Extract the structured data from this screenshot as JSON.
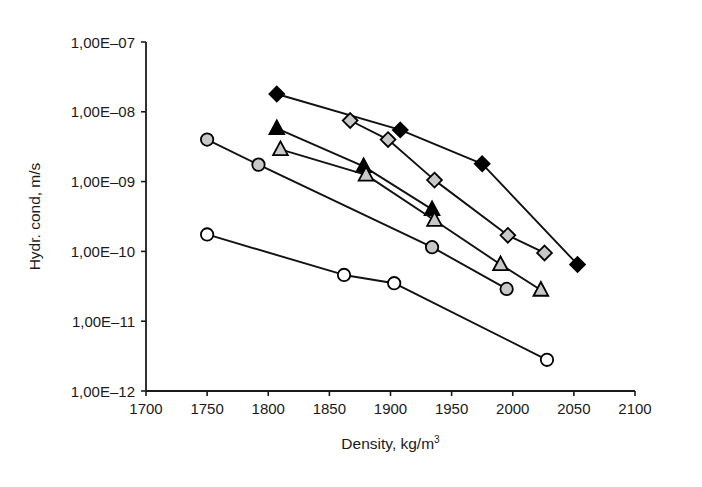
{
  "chart_data": {
    "type": "line",
    "title": "",
    "xlabel": "Density, kg/m3",
    "xlabel_base": "Density, kg/m",
    "xlabel_sup": "3",
    "ylabel": "Hydr. cond, m/s",
    "xlim": [
      1700,
      2100
    ],
    "ylim": [
      1e-12,
      1e-07
    ],
    "yscale": "log",
    "xticks": [
      1700,
      1750,
      1800,
      1850,
      1900,
      1950,
      2000,
      2050,
      2100
    ],
    "xtick_labels": [
      "1700",
      "1750",
      "1800",
      "1850",
      "1900",
      "1950",
      "2000",
      "2050",
      "2100"
    ],
    "yticks": [
      1e-07,
      1e-08,
      1e-09,
      1e-10,
      1e-11,
      1e-12
    ],
    "ytick_labels": [
      "1,00E–07",
      "1,00E–08",
      "1,00E–09",
      "1,00E–10",
      "1,00E–11",
      "1,00E–12"
    ],
    "grid": false,
    "legend": "none",
    "series": [
      {
        "name": "filled-diamond",
        "marker": "diamond",
        "fill": "#000000",
        "stroke": "#000000",
        "x": [
          1807,
          1908,
          1975,
          2053
        ],
        "y": [
          1.8e-08,
          5.5e-09,
          1.8e-09,
          6.5e-11
        ]
      },
      {
        "name": "gray-diamond",
        "marker": "diamond",
        "fill": "#c8c8c8",
        "stroke": "#000000",
        "x": [
          1867,
          1898,
          1936,
          1996,
          2026
        ],
        "y": [
          7.5e-09,
          4e-09,
          1.05e-09,
          1.7e-10,
          9.5e-11
        ]
      },
      {
        "name": "filled-triangle",
        "marker": "triangle",
        "fill": "#000000",
        "stroke": "#000000",
        "x": [
          1807,
          1878,
          1934
        ],
        "y": [
          5.8e-09,
          1.65e-09,
          4e-10
        ]
      },
      {
        "name": "gray-triangle",
        "marker": "triangle",
        "fill": "#c8c8c8",
        "stroke": "#000000",
        "x": [
          1810,
          1880,
          1936,
          1990,
          2023
        ],
        "y": [
          2.9e-09,
          1.25e-09,
          2.8e-10,
          6.5e-11,
          2.8e-11
        ]
      },
      {
        "name": "gray-circle",
        "marker": "circle",
        "fill": "#c8c8c8",
        "stroke": "#000000",
        "x": [
          1750,
          1792,
          1934,
          1995
        ],
        "y": [
          4e-09,
          1.75e-09,
          1.15e-10,
          2.9e-11
        ]
      },
      {
        "name": "open-circle",
        "marker": "circle",
        "fill": "#ffffff",
        "stroke": "#000000",
        "x": [
          1750,
          1862,
          1903,
          2028
        ],
        "y": [
          1.75e-10,
          4.6e-11,
          3.5e-11,
          2.8e-12
        ]
      }
    ]
  },
  "figure": {
    "background": "#ffffff",
    "axis_color": "#1a1a1a",
    "marker_gray": "#c8c8c8",
    "marker_black": "#000000"
  }
}
